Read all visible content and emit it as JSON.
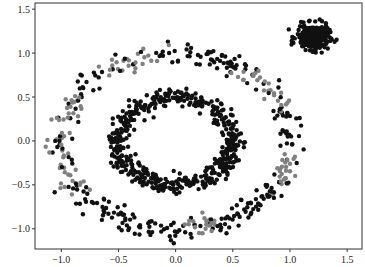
{
  "chart_data": {
    "type": "scatter",
    "title": "",
    "xlabel": "",
    "ylabel": "",
    "xlim": [
      -1.23,
      1.63
    ],
    "ylim": [
      -1.23,
      1.57
    ],
    "xticks": [
      -1.0,
      -0.5,
      0.0,
      0.5,
      1.0,
      1.5
    ],
    "xtick_labels": [
      "−1.0",
      "−0.5",
      "0.0",
      "0.5",
      "1.0",
      "1.5"
    ],
    "yticks": [
      -1.0,
      -0.5,
      0.0,
      0.5,
      1.0,
      1.5
    ],
    "ytick_labels": [
      "−1.0",
      "−0.5",
      "0.0",
      "0.5",
      "1.0",
      "1.5"
    ],
    "grid": false,
    "legend": null,
    "marker_size": 2.2,
    "colors": {
      "cluster": "#111111",
      "noise": "#808080",
      "axis": "#333333"
    },
    "series": [
      {
        "name": "inner_ring",
        "shape": "circle",
        "center": [
          0.0,
          0.0
        ],
        "radius_x": 0.5,
        "radius_y": 0.5,
        "noise": 0.05,
        "n": 500,
        "color": "#111111"
      },
      {
        "name": "outer_ring",
        "shape": "circle",
        "center": [
          0.0,
          0.0
        ],
        "radius_x": 1.0,
        "radius_y": 1.0,
        "noise": 0.06,
        "n": 420,
        "color": "#111111",
        "gray_arcs_deg": [
          [
            95,
            125
          ],
          [
            150,
            215
          ],
          [
            20,
            55
          ],
          [
            330,
            355
          ],
          [
            275,
            290
          ]
        ]
      },
      {
        "name": "blob",
        "shape": "gaussian",
        "center": [
          1.2,
          1.18
        ],
        "std": 0.07,
        "n": 280,
        "color": "#111111"
      }
    ]
  }
}
